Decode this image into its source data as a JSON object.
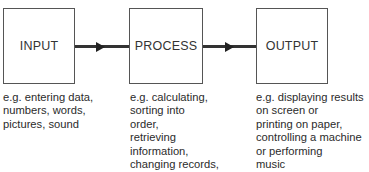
{
  "diagram": {
    "boxes": [
      {
        "id": "input",
        "label": "INPUT"
      },
      {
        "id": "process",
        "label": "PROCESS"
      },
      {
        "id": "output",
        "label": "OUTPUT"
      }
    ],
    "descriptions": [
      {
        "for": "input",
        "lines": [
          "e.g. entering data,",
          "numbers, words,",
          "pictures, sound"
        ]
      },
      {
        "for": "process",
        "lines": [
          "e.g. calculating,",
          "sorting into",
          "order,",
          "retrieving",
          "information,",
          "changing records,",
          "text"
        ]
      },
      {
        "for": "output",
        "lines": [
          "e.g. displaying results",
          "on screen or",
          "printing on paper,",
          "controlling a machine",
          "or performing",
          "music"
        ]
      }
    ],
    "arrows": [
      {
        "from": "input",
        "to": "process"
      },
      {
        "from": "process",
        "to": "output"
      }
    ]
  }
}
